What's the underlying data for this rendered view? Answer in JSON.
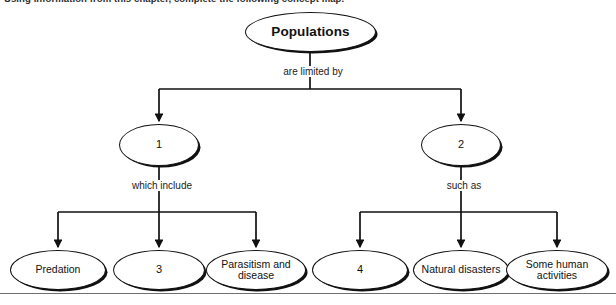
{
  "instruction": "Using information from this chapter, complete the following concept map.",
  "concept_map": {
    "root": {
      "label": "Populations"
    },
    "root_edge_label": "are limited by",
    "branches": [
      {
        "node": {
          "label": "1"
        },
        "edge_label": "which include",
        "children": [
          {
            "label": "Predation"
          },
          {
            "label": "3"
          },
          {
            "label": "Parasitism and disease"
          }
        ]
      },
      {
        "node": {
          "label": "2"
        },
        "edge_label": "such as",
        "children": [
          {
            "label": "4"
          },
          {
            "label": "Natural disasters"
          },
          {
            "label": "Some human activities"
          }
        ]
      }
    ]
  },
  "colors": {
    "stroke": "#111111",
    "text": "#111111",
    "background": "#ffffff",
    "rule": "#6f6f6f"
  }
}
